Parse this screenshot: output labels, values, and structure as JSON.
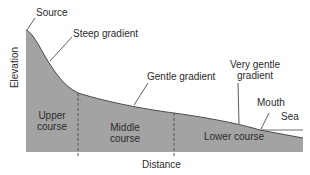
{
  "diagram": {
    "axes": {
      "y_label": "Elevation",
      "x_label": "Distance"
    },
    "annotations": {
      "source": "Source",
      "steep": "Steep gradient",
      "gentle": "Gentle gradient",
      "very_gentle_line1": "Very gentle",
      "very_gentle_line2": "gradient",
      "mouth": "Mouth",
      "sea": "Sea"
    },
    "sections": {
      "upper_line1": "Upper",
      "upper_line2": "course",
      "middle_line1": "Middle",
      "middle_line2": "course",
      "lower": "Lower course"
    },
    "colors": {
      "fill": "#a3a3a3",
      "line": "#3a3a3a",
      "text": "#2b2b2b"
    }
  }
}
